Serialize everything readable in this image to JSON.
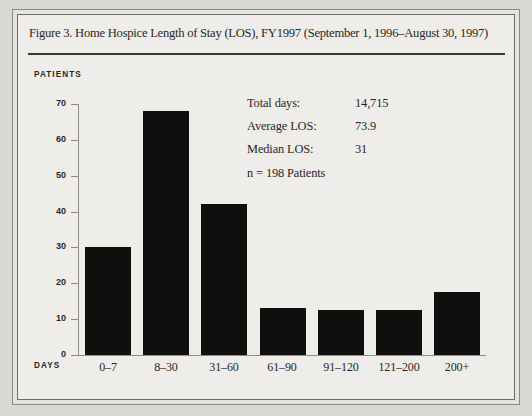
{
  "figure": {
    "caption": "Figure 3. Home Hospice Length of Stay (LOS), FY1997 (September 1, 1996–August 30, 1997)"
  },
  "stats": {
    "rows": [
      {
        "key": "Total days:",
        "value": "14,715"
      },
      {
        "key": "Average LOS:",
        "value": "73.9"
      },
      {
        "key": "Median LOS:",
        "value": "31"
      }
    ],
    "note": "n = 198 Patients"
  },
  "chart_data": {
    "type": "bar",
    "title": "Figure 3. Home Hospice Length of Stay (LOS), FY1997 (September 1, 1996–August 30, 1997)",
    "xlabel": "DAYS",
    "ylabel": "PATIENTS",
    "categories": [
      "0–7",
      "8–30",
      "31–60",
      "61–90",
      "91–120",
      "121–200",
      "200+"
    ],
    "values": [
      30,
      68,
      42,
      13,
      12.5,
      12.5,
      17.5
    ],
    "ylim": [
      0,
      70
    ],
    "yticks": [
      0,
      10,
      20,
      30,
      40,
      50,
      60,
      70
    ],
    "ytick_labels": [
      "0",
      "10",
      "20",
      "30",
      "40",
      "50",
      "60",
      "70"
    ],
    "grid": false,
    "legend": false,
    "bar_color": "#100f0e"
  },
  "colors": {
    "bar": "#100f0e",
    "axis": "#8e8c88",
    "text": "#2a2724",
    "page_bg": "#d9d8d4",
    "panel_bg": "#eeedea"
  }
}
